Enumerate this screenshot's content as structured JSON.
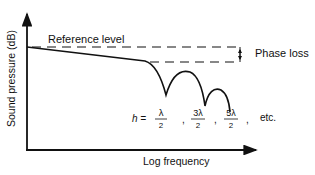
{
  "diagram": {
    "y_axis_label": "Sound pressure (dB)",
    "x_axis_label": "Log frequency",
    "reference_label": "Reference level",
    "phase_loss_label": "Phase loss",
    "formula": {
      "variable": "h =",
      "terms": [
        {
          "num": "λ",
          "den": "2"
        },
        {
          "num": "3λ",
          "den": "2"
        },
        {
          "num": "5λ",
          "den": "2"
        }
      ],
      "separator": ",",
      "suffix": "etc."
    },
    "colors": {
      "ink": "#111111",
      "background": "#ffffff"
    }
  }
}
